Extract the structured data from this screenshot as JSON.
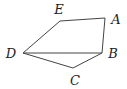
{
  "diagram": {
    "type": "geometry",
    "shape": "pentagon",
    "vertices": [
      {
        "label": "A",
        "x": 105,
        "y": 18,
        "lx": 116,
        "ly": 24
      },
      {
        "label": "B",
        "x": 102,
        "y": 53,
        "lx": 113,
        "ly": 58
      },
      {
        "label": "C",
        "x": 73,
        "y": 68,
        "lx": 75,
        "ly": 85
      },
      {
        "label": "D",
        "x": 23,
        "y": 53,
        "lx": 11,
        "ly": 58
      },
      {
        "label": "E",
        "x": 60,
        "y": 21,
        "lx": 59,
        "ly": 14
      }
    ],
    "edges": [
      [
        "A",
        "B"
      ],
      [
        "B",
        "C"
      ],
      [
        "C",
        "D"
      ],
      [
        "D",
        "E"
      ],
      [
        "E",
        "A"
      ],
      [
        "D",
        "B"
      ]
    ],
    "colors": {
      "stroke": "#444444",
      "label": "#222222",
      "background": "#ffffff"
    }
  }
}
